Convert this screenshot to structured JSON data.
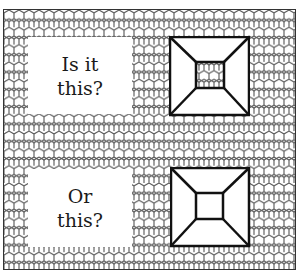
{
  "panels": [
    {
      "question_line1": "Is it",
      "question_line2": "this?",
      "figure": "pyramid-frustum-inner-patterned"
    },
    {
      "question_line1": "Or",
      "question_line2": "this?",
      "figure": "pyramid-frustum-inner-blank"
    }
  ],
  "colors": {
    "line": "#111111",
    "pattern": "#555555",
    "background": "#ffffff"
  }
}
